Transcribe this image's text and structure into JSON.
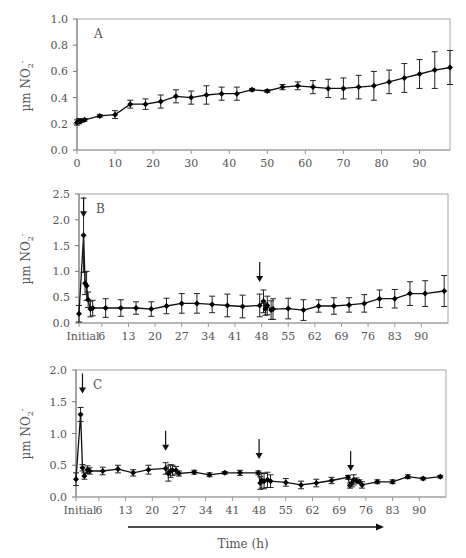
{
  "figure": {
    "xlabel": "Time (h)",
    "ylabel_main": "µm NO",
    "ylabel_sub": "2",
    "ylabel_sup": "-"
  },
  "chart_data": [
    {
      "type": "line",
      "panel": "A",
      "title": "A",
      "xlabel": "",
      "ylabel": "µm NO2-",
      "ylim": [
        0,
        1.0
      ],
      "yticks": [
        0.0,
        0.2,
        0.4,
        0.6,
        0.8,
        1.0
      ],
      "ytick_labels": [
        "0.0",
        "0.2",
        "0.4",
        "0.6",
        "0.8",
        "1.0"
      ],
      "xlim": [
        0,
        98
      ],
      "xticks": [
        0,
        10,
        20,
        30,
        40,
        50,
        60,
        70,
        80,
        90
      ],
      "xtick_labels": [
        "0",
        "10",
        "20",
        "30",
        "40",
        "50",
        "60",
        "70",
        "80",
        "90"
      ],
      "grid": false,
      "arrows": [],
      "x": [
        0,
        0.5,
        1,
        2,
        6,
        10,
        14,
        18,
        22,
        26,
        30,
        34,
        38,
        42,
        46,
        50,
        54,
        58,
        62,
        66,
        70,
        74,
        78,
        82,
        86,
        90,
        94,
        98
      ],
      "y": [
        0.21,
        0.22,
        0.22,
        0.23,
        0.26,
        0.27,
        0.35,
        0.35,
        0.37,
        0.41,
        0.4,
        0.42,
        0.43,
        0.43,
        0.46,
        0.45,
        0.48,
        0.49,
        0.48,
        0.47,
        0.47,
        0.48,
        0.49,
        0.52,
        0.55,
        0.58,
        0.61,
        0.63
      ],
      "err": [
        0.02,
        0.02,
        0.01,
        0.01,
        0.01,
        0.03,
        0.03,
        0.04,
        0.05,
        0.05,
        0.05,
        0.07,
        0.05,
        0.05,
        0.01,
        0.01,
        0.02,
        0.03,
        0.05,
        0.07,
        0.08,
        0.09,
        0.11,
        0.09,
        0.11,
        0.11,
        0.14,
        0.13
      ]
    },
    {
      "type": "line",
      "panel": "B",
      "title": "B",
      "xlabel": "",
      "ylabel": "µm NO2-",
      "ylim": [
        0,
        2.5
      ],
      "yticks": [
        0.0,
        0.5,
        1.0,
        1.5,
        2.0,
        2.5
      ],
      "ytick_labels": [
        "0.0",
        "0.5",
        "1.0",
        "1.5",
        "2.0",
        "2.5"
      ],
      "xlim": [
        0,
        97
      ],
      "xticks": [
        0,
        6,
        13,
        20,
        27,
        34,
        41,
        48,
        55,
        62,
        69,
        76,
        83,
        90
      ],
      "xtick_labels": [
        "Initial",
        "6",
        "13",
        "20",
        "27",
        "34",
        "41",
        "48",
        "55",
        "62",
        "69",
        "76",
        "83",
        "90"
      ],
      "grid": false,
      "arrows": [
        1.2,
        47.5
      ],
      "x": [
        0,
        1.2,
        1.6,
        2.0,
        2.4,
        3.0,
        3.6,
        7,
        11,
        15,
        19,
        23,
        27,
        31,
        35,
        39,
        43,
        47.5,
        48.5,
        49,
        49.5,
        50.5,
        51,
        55,
        59,
        63,
        67,
        71,
        75,
        79,
        83,
        87,
        91,
        96
      ],
      "y": [
        0.18,
        1.7,
        0.77,
        0.72,
        0.45,
        0.27,
        0.29,
        0.29,
        0.29,
        0.29,
        0.27,
        0.33,
        0.38,
        0.38,
        0.36,
        0.34,
        0.32,
        0.34,
        0.42,
        0.27,
        0.34,
        0.25,
        0.27,
        0.28,
        0.25,
        0.33,
        0.33,
        0.35,
        0.38,
        0.47,
        0.47,
        0.57,
        0.57,
        0.62
      ],
      "err": [
        0.16,
        0.72,
        0.22,
        0.28,
        0.15,
        0.15,
        0.15,
        0.18,
        0.16,
        0.12,
        0.14,
        0.15,
        0.19,
        0.19,
        0.16,
        0.22,
        0.22,
        0.22,
        0.22,
        0.12,
        0.18,
        0.18,
        0.2,
        0.2,
        0.2,
        0.12,
        0.16,
        0.14,
        0.17,
        0.17,
        0.18,
        0.23,
        0.25,
        0.3
      ]
    },
    {
      "type": "line",
      "panel": "C",
      "title": "C",
      "xlabel": "Time (h)",
      "ylabel": "µm NO2-",
      "ylim": [
        0,
        2.0
      ],
      "yticks": [
        0.0,
        0.5,
        1.0,
        1.5,
        2.0
      ],
      "ytick_labels": [
        "0.0",
        "0.5",
        "1.0",
        "1.5",
        "2.0"
      ],
      "xlim": [
        0,
        97
      ],
      "xticks": [
        0,
        6,
        13,
        20,
        27,
        34,
        41,
        48,
        55,
        62,
        69,
        76,
        83,
        90
      ],
      "xtick_labels": [
        "Initial",
        "6",
        "13",
        "20",
        "27",
        "34",
        "41",
        "48",
        "55",
        "62",
        "69",
        "76",
        "83",
        "90"
      ],
      "grid": false,
      "arrows": [
        1.7,
        23.5,
        48,
        72
      ],
      "x": [
        0,
        1.2,
        1.7,
        2.2,
        3.0,
        3.6,
        7,
        11,
        15,
        19,
        23.5,
        24.2,
        24.8,
        25.3,
        26.2,
        27,
        31,
        35,
        39,
        43,
        47.8,
        48.3,
        48.7,
        49.3,
        50.2,
        51,
        55,
        59,
        63,
        67,
        71.3,
        71.8,
        72.3,
        72.8,
        73.5,
        74.3,
        75,
        79,
        83,
        87,
        91,
        95.5
      ],
      "y": [
        0.28,
        1.3,
        0.46,
        0.33,
        0.43,
        0.41,
        0.41,
        0.44,
        0.38,
        0.43,
        0.45,
        0.37,
        0.41,
        0.42,
        0.42,
        0.37,
        0.39,
        0.35,
        0.38,
        0.38,
        0.38,
        0.22,
        0.26,
        0.25,
        0.27,
        0.25,
        0.23,
        0.19,
        0.22,
        0.26,
        0.31,
        0.18,
        0.22,
        0.27,
        0.26,
        0.24,
        0.19,
        0.24,
        0.24,
        0.32,
        0.29,
        0.32
      ],
      "err": [
        0.1,
        0.11,
        0.05,
        0.05,
        0.06,
        0.05,
        0.06,
        0.06,
        0.05,
        0.07,
        0.09,
        0.12,
        0.1,
        0.08,
        0.06,
        0.04,
        0.03,
        0.03,
        0.02,
        0.04,
        0.03,
        0.1,
        0.12,
        0.12,
        0.12,
        0.1,
        0.06,
        0.06,
        0.06,
        0.05,
        0.03,
        0.04,
        0.06,
        0.08,
        0.04,
        0.03,
        0.05,
        0.03,
        0.03,
        0.03,
        0.02,
        0.02
      ]
    }
  ]
}
